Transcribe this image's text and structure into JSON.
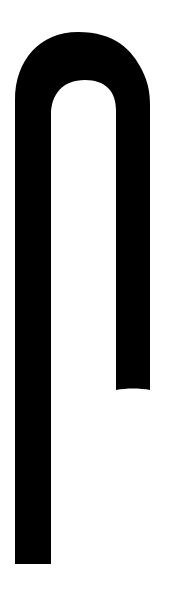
{
  "canvas": {
    "width": 171,
    "height": 594,
    "background": "#ffffff"
  },
  "shape": {
    "name": "inverted-j-hook",
    "fill": "#000000",
    "left_leg": {
      "x_left": 15,
      "x_right": 51,
      "bottom": 564
    },
    "right_leg": {
      "x_left": 116,
      "x_right": 150,
      "bottom": 390
    },
    "arch": {
      "outer_top": 32,
      "inner_top": 80
    }
  }
}
